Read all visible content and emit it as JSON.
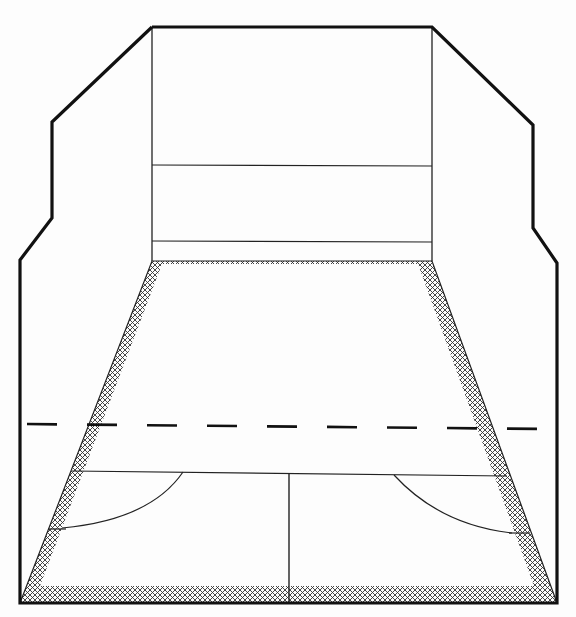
{
  "diagram": {
    "title": "",
    "colors": {
      "background": "#fdfdfd",
      "line": "#1a1a1a",
      "hatch": "#333333"
    },
    "outline_points": "152,27 52,122 52,218 20,260 20,603 557,603 557,263 533,228 533,125 432,27 152,27",
    "front_wall": {
      "left": 152,
      "right": 432,
      "top": 27,
      "tin_line_y": 165,
      "service_line_y": 241,
      "floor_y": 261
    },
    "floor": {
      "top_left": [
        152,
        261
      ],
      "top_right": [
        432,
        261
      ],
      "bottom_left": [
        20,
        603
      ],
      "bottom_right": [
        557,
        603
      ]
    },
    "short_line_y": 473,
    "half_court_line_x": 289,
    "dashed_line": {
      "y_left": 424,
      "y_right": 429,
      "x1": 22,
      "x2": 545
    }
  }
}
